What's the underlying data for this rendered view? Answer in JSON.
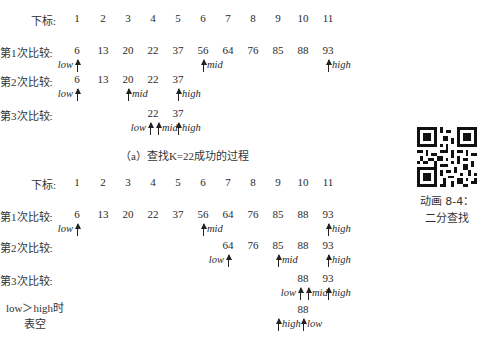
{
  "columns_x": [
    77,
    103,
    128,
    153,
    178,
    203,
    228,
    253,
    278,
    303,
    328
  ],
  "part_a": {
    "index_label": "下标:",
    "indices": [
      "1",
      "2",
      "3",
      "4",
      "5",
      "6",
      "7",
      "8",
      "9",
      "10",
      "11"
    ],
    "rows": [
      {
        "label": "第1次比较:",
        "values": [
          "6",
          "13",
          "20",
          "22",
          "37",
          "56",
          "64",
          "76",
          "85",
          "88",
          "93"
        ],
        "start": 1,
        "pointers": [
          {
            "name": "low",
            "col": 1,
            "side": "left"
          },
          {
            "name": "mid",
            "col": 6,
            "side": "right"
          },
          {
            "name": "high",
            "col": 11,
            "side": "right"
          }
        ]
      },
      {
        "label": "第2次比较:",
        "values": [
          "6",
          "13",
          "20",
          "22",
          "37"
        ],
        "start": 1,
        "pointers": [
          {
            "name": "low",
            "col": 1,
            "side": "left"
          },
          {
            "name": "mid",
            "col": 3,
            "side": "right"
          },
          {
            "name": "high",
            "col": 5,
            "side": "right"
          }
        ]
      },
      {
        "label": "第3次比较:",
        "values": [
          "22",
          "37"
        ],
        "start": 4,
        "pointers": [
          {
            "name": "low",
            "col": 4,
            "side": "left"
          },
          {
            "name": "mid",
            "col": 4,
            "side": "right"
          },
          {
            "name": "high",
            "col": 5,
            "side": "right"
          }
        ]
      }
    ],
    "caption": "（a）查找K=22成功的过程"
  },
  "part_b": {
    "index_label": "下标:",
    "indices": [
      "1",
      "2",
      "3",
      "4",
      "5",
      "6",
      "7",
      "8",
      "9",
      "10",
      "11"
    ],
    "rows": [
      {
        "label": "第1次比较:",
        "values": [
          "6",
          "13",
          "20",
          "22",
          "37",
          "56",
          "64",
          "76",
          "85",
          "88",
          "93"
        ],
        "start": 1,
        "pointers": [
          {
            "name": "low",
            "col": 1,
            "side": "left"
          },
          {
            "name": "mid",
            "col": 6,
            "side": "right"
          },
          {
            "name": "high",
            "col": 11,
            "side": "right"
          }
        ]
      },
      {
        "label": "第2次比较:",
        "values": [
          "64",
          "76",
          "85",
          "88",
          "93"
        ],
        "start": 7,
        "pointers": [
          {
            "name": "low",
            "col": 7,
            "side": "left"
          },
          {
            "name": "mid",
            "col": 9,
            "side": "right"
          },
          {
            "name": "high",
            "col": 11,
            "side": "right"
          }
        ]
      },
      {
        "label": "第3次比较:",
        "values": [
          "88",
          "93"
        ],
        "start": 10,
        "pointers": [
          {
            "name": "low",
            "col": 10,
            "side": "left"
          },
          {
            "name": "mid",
            "col": 10,
            "side": "right"
          },
          {
            "name": "high",
            "col": 11,
            "side": "right"
          }
        ]
      },
      {
        "label": "low＞high时\n表空",
        "values": [
          "88"
        ],
        "start": 10,
        "pointers": [
          {
            "name": "high",
            "col": 9,
            "side": "right"
          },
          {
            "name": "low",
            "col": 10,
            "side": "right"
          }
        ]
      }
    ]
  },
  "sidebar": {
    "qr_icon": "qr-code-icon",
    "animation_label": "动画 8-4：",
    "animation_title": "二分查找"
  }
}
